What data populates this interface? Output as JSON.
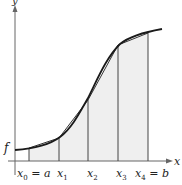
{
  "figure": {
    "function_label": "f",
    "axis_labels": {
      "x": "x",
      "y": "y"
    },
    "x_tick_labels": [
      "x₀ = a",
      "x₁",
      "x₂",
      "x₃",
      "x₄ = b"
    ],
    "subintervals": 4,
    "colors": {
      "fill": "#efefef",
      "curve": "#1a1a1a",
      "lines": "#444444",
      "axis": "#555555"
    }
  },
  "labels": {
    "f": "f",
    "x_axis": "x",
    "y_axis": "y",
    "x0": "x",
    "x0_sub": "0",
    "x0_eq": " = a",
    "x1": "x",
    "x1_sub": "1",
    "x2": "x",
    "x2_sub": "2",
    "x3": "x",
    "x3_sub": "3",
    "x4": "x",
    "x4_sub": "4",
    "x4_eq": " = b"
  }
}
